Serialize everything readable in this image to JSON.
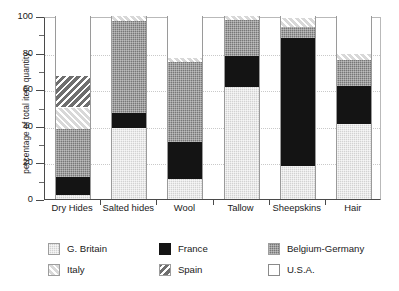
{
  "chart_data": {
    "type": "bar",
    "subtype": "stacked-bar-100",
    "title": "",
    "xlabel": "",
    "ylabel": "percentage of total item quantity",
    "ylim": [
      0,
      100
    ],
    "yticks": [
      0,
      20,
      40,
      60,
      80,
      100
    ],
    "ytick_labels": [
      "0",
      "20",
      "40",
      "60",
      "80",
      "100"
    ],
    "yminor_ticks": [
      10,
      30,
      50,
      70,
      90
    ],
    "grid": "horizontal-dotted",
    "legend_position": "bottom",
    "categories": [
      "Dry Hides",
      "Salted hides",
      "Wool",
      "Tallow",
      "Sheepskins",
      "Hair"
    ],
    "series": [
      {
        "name": "G. Britain",
        "key": "gb",
        "color": "#d2d2d2",
        "pattern": "light-gray",
        "values": [
          2,
          39,
          11,
          61,
          18,
          41
        ]
      },
      {
        "name": "France",
        "key": "fr",
        "color": "#141414",
        "pattern": "solid-black",
        "values": [
          10,
          8,
          20,
          17,
          70,
          21
        ]
      },
      {
        "name": "Belgium-Germany",
        "key": "bg",
        "color": "#777777",
        "pattern": "dark-gray",
        "values": [
          26,
          50,
          44,
          20,
          6,
          14
        ]
      },
      {
        "name": "Italy",
        "key": "it",
        "color": "#d8d8d8",
        "pattern": "hatch-forward",
        "values": [
          12,
          3,
          2,
          2,
          5,
          3
        ]
      },
      {
        "name": "Spain",
        "key": "sp",
        "color": "#6f6f6f",
        "pattern": "hatch-backward",
        "values": [
          17,
          0,
          0,
          0,
          0,
          0
        ]
      },
      {
        "name": "U.S.A.",
        "key": "us",
        "color": "#ffffff",
        "pattern": "white",
        "values": [
          33,
          0,
          23,
          0,
          1,
          21
        ]
      }
    ],
    "stack_tops": {
      "Dry Hides": {
        "gb": 2,
        "fr": 12,
        "bg": 38,
        "it": 50,
        "sp": 67,
        "us": 100
      },
      "Salted hides": {
        "gb": 39,
        "fr": 47,
        "bg": 97,
        "it": 100,
        "sp": 100,
        "us": 100
      },
      "Wool": {
        "gb": 11,
        "fr": 31,
        "bg": 75,
        "it": 77,
        "sp": 77,
        "us": 100
      },
      "Tallow": {
        "gb": 61,
        "fr": 78,
        "bg": 98,
        "it": 100,
        "sp": 100,
        "us": 100
      },
      "Sheepskins": {
        "gb": 18,
        "fr": 88,
        "bg": 94,
        "it": 99,
        "sp": 99,
        "us": 100
      },
      "Hair": {
        "gb": 41,
        "fr": 62,
        "bg": 76,
        "it": 79,
        "sp": 79,
        "us": 100
      }
    }
  },
  "legend": {
    "rows": [
      [
        {
          "label": "G. Britain",
          "key": "gb"
        },
        {
          "label": "France",
          "key": "fr"
        },
        {
          "label": "Belgium-Germany",
          "key": "bg"
        }
      ],
      [
        {
          "label": "Italy",
          "key": "it"
        },
        {
          "label": "Spain",
          "key": "sp"
        },
        {
          "label": "U.S.A.",
          "key": "us"
        }
      ]
    ]
  }
}
